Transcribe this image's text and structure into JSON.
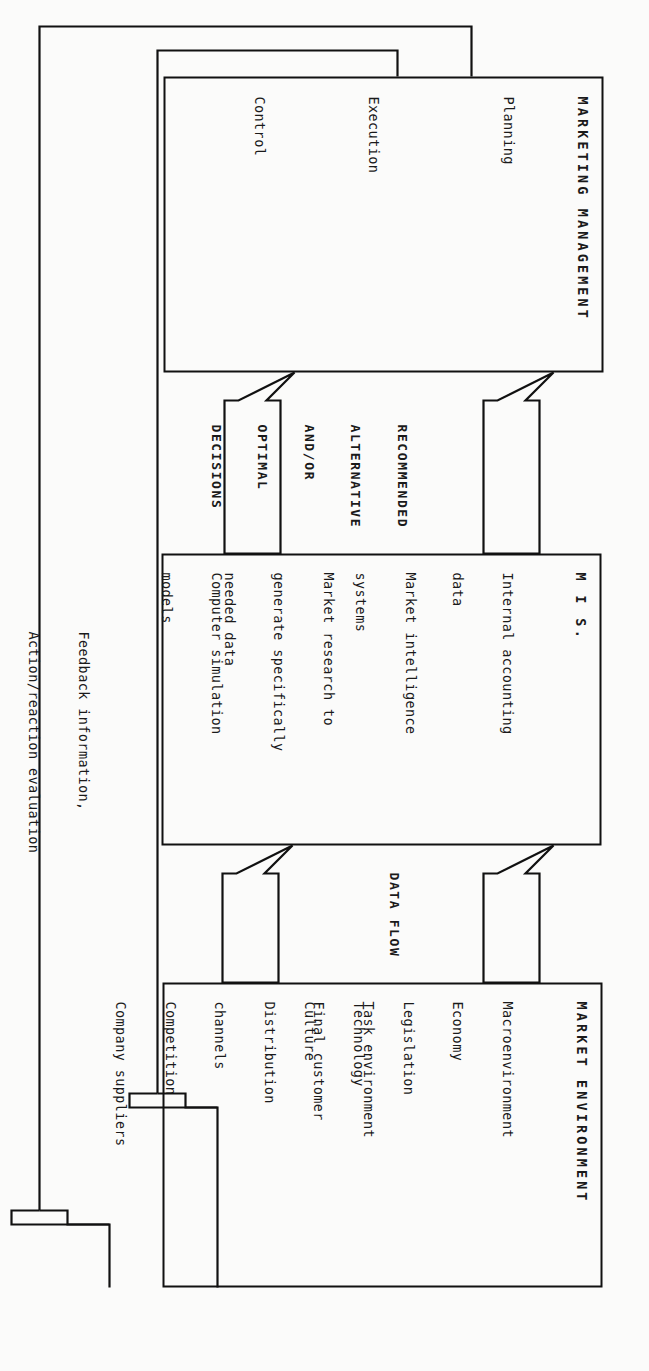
{
  "diagram": {
    "orientation": "rotated-90",
    "stroke_color": "#111111",
    "background_color": "#fbfbfa"
  },
  "boxes": [
    {
      "id": "marketing-management",
      "title": "MARKETING MANAGEMENT",
      "groups": [
        {
          "id": "planning",
          "items": [
            "Planning"
          ]
        },
        {
          "id": "execution",
          "items": [
            "Execution"
          ]
        },
        {
          "id": "control",
          "items": [
            "Control"
          ]
        }
      ]
    },
    {
      "id": "mis",
      "title": "M I S.",
      "groups": [
        {
          "id": "internal-accounting",
          "items": [
            "Internal accounting",
            "data"
          ]
        },
        {
          "id": "market-intelligence",
          "items": [
            "Market intelligence",
            "systems"
          ]
        },
        {
          "id": "market-research",
          "items": [
            "Market research to",
            "generate specifically",
            "needed data"
          ]
        },
        {
          "id": "computer-simulation",
          "items": [
            "Computer simulation",
            "models"
          ]
        }
      ]
    },
    {
      "id": "market-environment",
      "title": "MARKET ENVIRONMENT",
      "groups": [
        {
          "id": "macroenvironment",
          "items": [
            "Macroenvironment",
            "Economy",
            "Legislation",
            "Technology",
            "Culture"
          ]
        },
        {
          "id": "task-environment",
          "items": [
            "Task environment",
            "Final customer",
            "Distribution",
            "channels",
            "Competition",
            "Company suppliers"
          ]
        }
      ]
    }
  ],
  "flow_labels": {
    "recommendations": [
      "RECOMMENDED",
      "ALTERNATIVE",
      "AND/OR",
      "OPTIMAL",
      "DECISIONS"
    ],
    "data_flow": "DATA FLOW",
    "feedback": [
      "Feedback information,",
      "Action/reaction evaluation"
    ]
  },
  "arrows": [
    {
      "id": "mis-to-management-left",
      "kind": "block-arrow",
      "direction": "up"
    },
    {
      "id": "mis-to-management-right",
      "kind": "block-arrow",
      "direction": "up"
    },
    {
      "id": "environment-to-mis-left",
      "kind": "block-arrow",
      "direction": "up"
    },
    {
      "id": "environment-to-mis-right",
      "kind": "block-arrow",
      "direction": "up"
    },
    {
      "id": "feedback-to-environment-outer",
      "kind": "block-arrow",
      "direction": "left"
    },
    {
      "id": "feedback-to-environment-inner",
      "kind": "block-arrow",
      "direction": "left"
    }
  ]
}
